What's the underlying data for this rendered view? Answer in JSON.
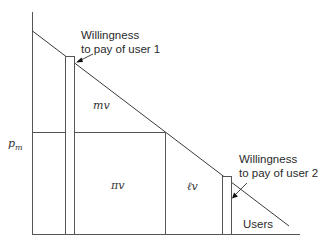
{
  "diagram": {
    "type": "demand-curve-pricing",
    "axis": {
      "y_label": "p",
      "y_label_subscript": "m",
      "x_label": "Users"
    },
    "regions": {
      "upper": "mv",
      "middle": "πv",
      "right": "ℓv"
    },
    "annotations": {
      "user1": {
        "line1": "Willingness",
        "line2": "to pay of user 1"
      },
      "user2": {
        "line1": "Willingness",
        "line2": "to pay of user 2"
      }
    },
    "colors": {
      "line": "#555555",
      "demand_line": "#3a3a3a",
      "text": "#2a2a2a",
      "background": "#ffffff"
    }
  }
}
